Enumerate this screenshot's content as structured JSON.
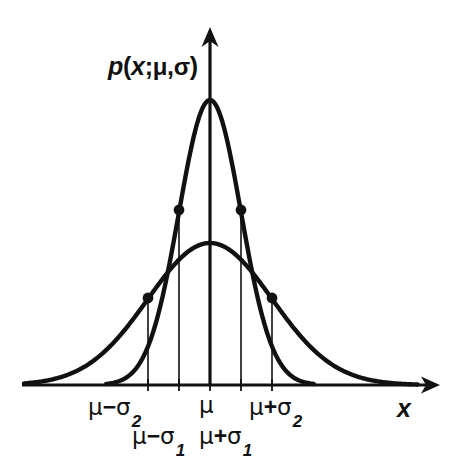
{
  "figure": {
    "title": "",
    "background_color": "#ffffff",
    "ink_color": "#111111",
    "y_axis_label": {
      "function": "p",
      "open_paren": "(",
      "variable": "x",
      "separator": ";",
      "mean_symbol": "μ",
      "comma": ",",
      "sigma_symbol": "σ",
      "close_paren": ")",
      "full_text": "p(x;μ,σ)"
    },
    "x_axis_label": "x",
    "tick_labels": [
      {
        "id": "mu-minus-sigma2",
        "mu": "μ",
        "op": "−",
        "sigma": "σ",
        "sub": "2",
        "full_text": "μ−σ₂",
        "row": "upper"
      },
      {
        "id": "mu-minus-sigma1",
        "mu": "μ",
        "op": "−",
        "sigma": "σ",
        "sub": "1",
        "full_text": "μ−σ₁",
        "row": "lower"
      },
      {
        "id": "mu",
        "mu": "μ",
        "op": "",
        "sigma": "",
        "sub": "",
        "full_text": "μ",
        "row": "upper"
      },
      {
        "id": "mu-plus-sigma1",
        "mu": "μ",
        "op": "+",
        "sigma": "σ",
        "sub": "1",
        "full_text": "μ+σ₁",
        "row": "lower"
      },
      {
        "id": "mu-plus-sigma2",
        "mu": "μ",
        "op": "+",
        "sigma": "σ",
        "sub": "2",
        "full_text": "μ+σ₂",
        "row": "upper"
      }
    ]
  },
  "chart_data": {
    "type": "line",
    "title": "",
    "xlabel": "x",
    "ylabel": "p(x;μ,σ)",
    "grid": false,
    "legend": "none",
    "axes": {
      "x_axis": {
        "origin_px": 22,
        "end_px": 440,
        "baseline_y_px": 385,
        "arrow": true,
        "label": "x"
      },
      "y_axis": {
        "x_px": 210,
        "top_px": 27,
        "bottom_px": 385,
        "arrow": true,
        "label": "p(x;μ,σ)"
      }
    },
    "x_ticks": [
      {
        "label": "μ−σ₂",
        "x_px": 148,
        "value": -2
      },
      {
        "label": "μ−σ₁",
        "x_px": 179,
        "value": -1
      },
      {
        "label": "μ",
        "x_px": 210,
        "value": 0
      },
      {
        "label": "μ+σ₁",
        "x_px": 241,
        "value": 1
      },
      {
        "label": "μ+σ₂",
        "x_px": 272,
        "value": 2
      }
    ],
    "series": [
      {
        "name": "narrow-gaussian-sigma1",
        "mean_px": 210,
        "sigma_px": 31,
        "peak_y_px": 100,
        "amplitude_px": 285,
        "inflection_points": [
          {
            "x_px": 179,
            "y_px": 210
          },
          {
            "x_px": 241,
            "y_px": 210
          }
        ]
      },
      {
        "name": "wide-gaussian-sigma2",
        "mean_px": 210,
        "sigma_px": 62,
        "peak_y_px": 243,
        "amplitude_px": 142,
        "inflection_points": [
          {
            "x_px": 148,
            "y_px": 298
          },
          {
            "x_px": 272,
            "y_px": 298
          }
        ]
      }
    ],
    "vertical_drop_lines": [
      {
        "x_px": 148,
        "from_y_px": 298,
        "to_y_px": 385
      },
      {
        "x_px": 179,
        "from_y_px": 210,
        "to_y_px": 385
      },
      {
        "x_px": 210,
        "from_y_px": 100,
        "to_y_px": 385
      },
      {
        "x_px": 241,
        "from_y_px": 210,
        "to_y_px": 385
      },
      {
        "x_px": 272,
        "from_y_px": 298,
        "to_y_px": 385
      }
    ],
    "annotation": "Two normal probability density curves sharing the same mean μ, with σ₂ = 2σ₁; filled dots mark the points of inflection at μ±σ."
  }
}
